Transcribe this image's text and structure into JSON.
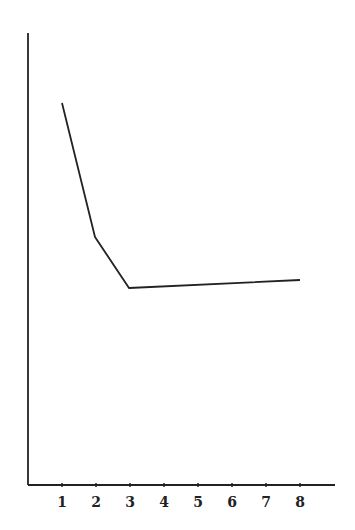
{
  "chart_data": {
    "type": "line",
    "title": "",
    "xlabel": "",
    "ylabel": "",
    "categories": [
      "1",
      "2",
      "3",
      "4",
      "5",
      "6",
      "7",
      "8"
    ],
    "x": [
      1,
      3,
      8
    ],
    "series": [
      {
        "name": "",
        "points": [
          [
            1,
            0.85
          ],
          [
            2,
            0.55
          ],
          [
            3,
            0.43
          ],
          [
            8,
            0.45
          ]
        ]
      }
    ],
    "y_ticks": [],
    "ylim": [
      0,
      1
    ],
    "xlim": [
      0,
      9
    ],
    "grid": false,
    "legend": "none",
    "line_color": "#222222"
  }
}
